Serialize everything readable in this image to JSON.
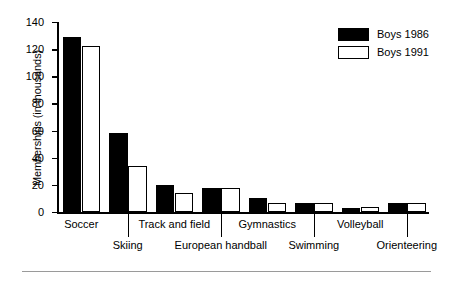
{
  "chart_data": {
    "type": "bar",
    "title": "",
    "xlabel": "",
    "ylabel": "Memberships (in thousands)",
    "ylim": [
      0,
      140
    ],
    "yticks": [
      0,
      20,
      40,
      60,
      80,
      100,
      120,
      140
    ],
    "ytick_labels": [
      "0",
      "20",
      "40",
      "60",
      "80",
      "100",
      "120",
      "140"
    ],
    "grid": false,
    "legend_position": "top-right",
    "categories": [
      "Soccer",
      "Skiing",
      "Track and field",
      "European handball",
      "Gymnastics",
      "Swimming",
      "Volleyball",
      "Orienteering"
    ],
    "series": [
      {
        "name": "Boys 1986",
        "color": "#000000",
        "fill": "solid",
        "values": [
          129,
          58,
          20,
          18,
          10,
          7,
          3,
          7
        ]
      },
      {
        "name": "Boys 1991",
        "color": "#ffffff",
        "fill": "hollow",
        "values": [
          122,
          34,
          14,
          18,
          7,
          7,
          4,
          7
        ]
      }
    ]
  },
  "legend": {
    "entries": [
      {
        "label": "Boys 1986"
      },
      {
        "label": "Boys 1991"
      }
    ]
  },
  "axes": {
    "y_title": "Memberships (in thousands)"
  }
}
